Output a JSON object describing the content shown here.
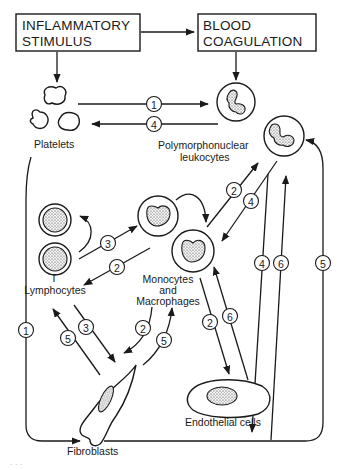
{
  "diagram": {
    "boxes": {
      "inflammatory_line1": "INFLAMMATORY",
      "inflammatory_line2": "STIMULUS",
      "coagulation_line1": "BLOOD",
      "coagulation_line2": "COAGULATION"
    },
    "labels": {
      "platelets": "Platelets",
      "pmn_line1": "Polymorphonuclear",
      "pmn_line2": "leukocytes",
      "t_line1": "T",
      "t_line2": "Lymphocytes",
      "mono_line1": "Monocytes",
      "mono_line2": "and",
      "mono_line3": "Macrophages",
      "endothelial": "Endothelial cells",
      "fibroblasts": "Fibroblasts"
    },
    "pathway_numbers": {
      "platelets_to_pmn": "1",
      "pmn_to_platelets": "4",
      "mono_to_pmn": "2",
      "pmn_to_mono": "4",
      "t_to_mono": "3",
      "mono_to_t": "2",
      "pmn_to_endo": "4",
      "endo_to_pmn": "6",
      "fibro_to_pmn": "5",
      "platelets_to_fibro": "1",
      "fibro_to_t": "5",
      "t_to_fibro": "3",
      "mono_to_fibro": "2",
      "fibro_to_mono": "5",
      "mono_to_endo": "2",
      "endo_to_mono": "6"
    },
    "footer_mark": "· · ·"
  }
}
